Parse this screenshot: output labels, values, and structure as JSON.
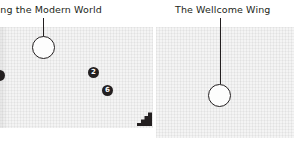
{
  "map": {
    "galleries": [
      {
        "id": "making-the-modern-world",
        "title": "king the Modern World",
        "lift_marker": "lift-circle"
      },
      {
        "id": "the-wellcome-wing",
        "title": "The Wellcome Wing",
        "lift_marker": "lift-circle"
      }
    ],
    "numbered_markers": [
      {
        "id": "marker-2",
        "label": "2"
      },
      {
        "id": "marker-6",
        "label": "6"
      },
      {
        "id": "marker-edge",
        "label": ""
      }
    ],
    "icons": {
      "stairs": "stairs-icon",
      "lift_left": "lift-circle-icon",
      "lift_right": "lift-circle-icon"
    },
    "colors": {
      "ink": "#231f20",
      "floor": "#f4f4f4",
      "marker_fill": "#231f20",
      "marker_text": "#ffffff"
    }
  }
}
